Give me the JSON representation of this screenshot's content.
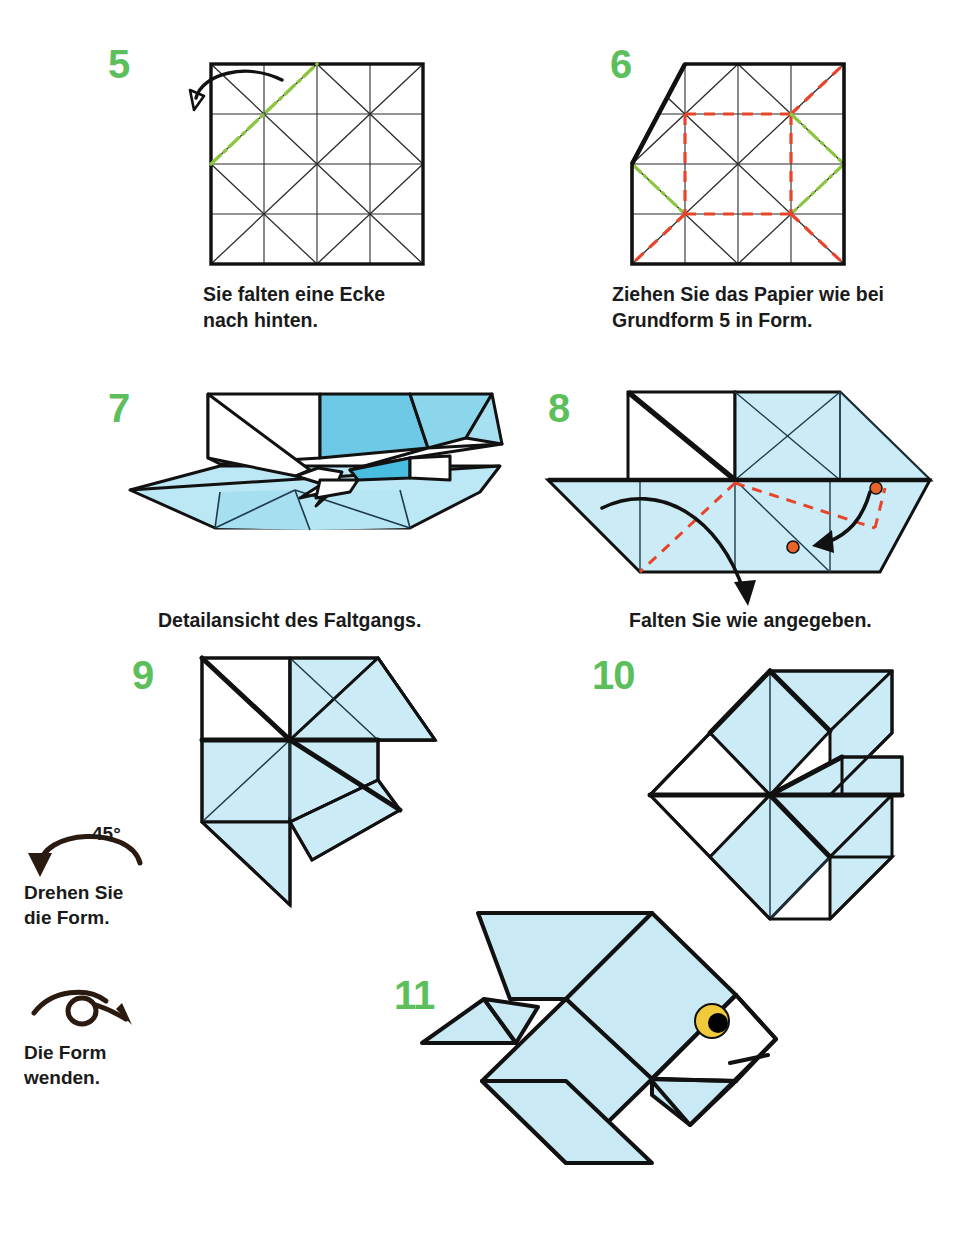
{
  "page": {
    "background": "#ffffff",
    "width": 977,
    "height": 1234
  },
  "palette": {
    "step_number_green": "#5cbf5c",
    "paper_light_blue": "#c9eaf4",
    "paper_mid_blue": "#9fdcef",
    "paper_deep_blue": "#62c7e8",
    "paper_white": "#ffffff",
    "outline_black": "#111111",
    "mountain_fold_green": "#8cc63f",
    "valley_fold_red": "#e8442a",
    "marker_dot_orange": "#e8632a",
    "eye_yellow": "#f0c93c",
    "eye_pupil": "#000000",
    "text_black": "#1a1a1a"
  },
  "steps": [
    {
      "id": "step-5",
      "number": "5",
      "caption": "Sie falten eine Ecke\nnach hinten.",
      "figure_name": "creased-square-with-fold-back-corner"
    },
    {
      "id": "step-6",
      "number": "6",
      "caption": "Ziehen Sie das Papier wie bei\nGrundform 5 in Form.",
      "figure_name": "creased-square-corner-folded-with-fold-lines"
    },
    {
      "id": "step-7",
      "number": "7",
      "caption": "Detailansicht des Faltgangs.",
      "figure_name": "three-dimensional-collapsing-detail-view"
    },
    {
      "id": "step-8",
      "number": "8",
      "caption": "Falten Sie wie angegeben.",
      "figure_name": "flattened-base-with-fold-arrows"
    },
    {
      "id": "step-9",
      "number": "9",
      "caption": "",
      "figure_name": "pinwheel-form-before-rotation"
    },
    {
      "id": "step-10",
      "number": "10",
      "caption": "",
      "figure_name": "pinwheel-form-rotated-45-degrees"
    },
    {
      "id": "step-11",
      "number": "11",
      "caption": "",
      "figure_name": "finished-origami-fish"
    }
  ],
  "symbols": [
    {
      "id": "rotate-symbol",
      "name": "rotate-arrow-icon",
      "angle_label": "45°",
      "caption": "Drehen Sie\ndie Form."
    },
    {
      "id": "flip-symbol",
      "name": "flip-over-icon",
      "angle_label": "",
      "caption": "Die Form\nwenden."
    }
  ],
  "legend": {
    "mountain_fold": "green dash-dot line",
    "valley_fold": "red dashed line",
    "existing_crease": "thin black line",
    "paper_edge": "thick black line",
    "action_arrow": "solid black curved arrow",
    "marker_dot": "orange dot"
  }
}
